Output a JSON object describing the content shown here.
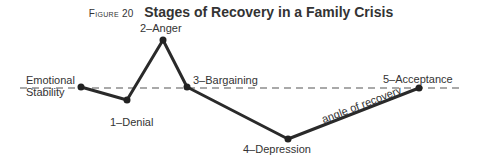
{
  "figure": {
    "label": "Figure 20",
    "title": "Stages of Recovery in a Family Crisis"
  },
  "baseline_label": [
    "Emotional",
    "Stability"
  ],
  "stages": [
    {
      "label": "1–Denial"
    },
    {
      "label": "2–Anger"
    },
    {
      "label": "3–Bargaining"
    },
    {
      "label": "4–Depression"
    },
    {
      "label": "5–Acceptance"
    }
  ],
  "annotation": "angle of recovery",
  "colors": {
    "line": "#2a2a2a",
    "dash": "#555555",
    "text": "#333333"
  }
}
